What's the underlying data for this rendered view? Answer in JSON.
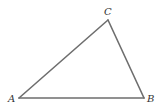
{
  "diagram": {
    "type": "triangle",
    "vertices": [
      {
        "id": "A",
        "label": "A"
      },
      {
        "id": "B",
        "label": "B"
      },
      {
        "id": "C",
        "label": "C"
      }
    ],
    "edges": [
      {
        "from": "A",
        "to": "B"
      },
      {
        "from": "B",
        "to": "C"
      },
      {
        "from": "C",
        "to": "A"
      }
    ],
    "colors": {
      "line": "#6e6e6e",
      "label": "#333333",
      "background": "#ffffff"
    }
  }
}
